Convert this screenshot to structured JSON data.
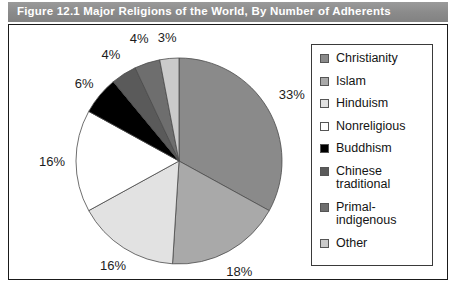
{
  "figure": {
    "title": "Figure 12.1  Major Religions of the World, By Number of Adherents",
    "title_band_color": "#8f8f8f",
    "frame_border_color": "#1a1a1a",
    "background_color": "#ffffff"
  },
  "chart_data": {
    "type": "pie",
    "title": "Figure 12.1  Major Religions of the World, By Number of Adherents",
    "xlabel": "",
    "ylabel": "",
    "unit": "%",
    "start_angle_deg": 0,
    "direction": "clockwise",
    "legend_position": "right",
    "grid": false,
    "categories": [
      "Christianity",
      "Islam",
      "Hinduism",
      "Nonreligious",
      "Buddhism",
      "Chinese traditional",
      "Primal-indigenous",
      "Other"
    ],
    "values": [
      33,
      18,
      16,
      16,
      6,
      4,
      4,
      3
    ],
    "value_labels": [
      "33%",
      "18%",
      "16%",
      "16%",
      "6%",
      "4%",
      "4%",
      "3%"
    ],
    "colors": [
      "#8a8a8a",
      "#a9a9a9",
      "#e2e2e2",
      "#ffffff",
      "#000000",
      "#5a5a5a",
      "#6e6e6e",
      "#cacaca"
    ],
    "slices": [
      {
        "label": "Christianity",
        "value": 33,
        "value_label": "33%",
        "color": "#8a8a8a"
      },
      {
        "label": "Islam",
        "value": 18,
        "value_label": "18%",
        "color": "#a9a9a9"
      },
      {
        "label": "Hinduism",
        "value": 16,
        "value_label": "16%",
        "color": "#e2e2e2"
      },
      {
        "label": "Nonreligious",
        "value": 16,
        "value_label": "16%",
        "color": "#ffffff"
      },
      {
        "label": "Buddhism",
        "value": 6,
        "value_label": "6%",
        "color": "#000000"
      },
      {
        "label": "Chinese traditional",
        "value": 4,
        "value_label": "4%",
        "color": "#5a5a5a"
      },
      {
        "label": "Primal-indigenous",
        "value": 4,
        "value_label": "4%",
        "color": "#6e6e6e"
      },
      {
        "label": "Other",
        "value": 3,
        "value_label": "3%",
        "color": "#cacaca"
      }
    ]
  },
  "legend": {
    "items": [
      {
        "label": "Christianity",
        "color": "#8a8a8a"
      },
      {
        "label": "Islam",
        "color": "#a9a9a9"
      },
      {
        "label": "Hinduism",
        "color": "#e2e2e2"
      },
      {
        "label": "Nonreligious",
        "color": "#ffffff"
      },
      {
        "label": "Buddhism",
        "color": "#000000"
      },
      {
        "label": "Chinese\ntraditional",
        "color": "#5a5a5a"
      },
      {
        "label": "Primal-\nindigenous",
        "color": "#6e6e6e"
      },
      {
        "label": "Other",
        "color": "#cacaca"
      }
    ]
  }
}
